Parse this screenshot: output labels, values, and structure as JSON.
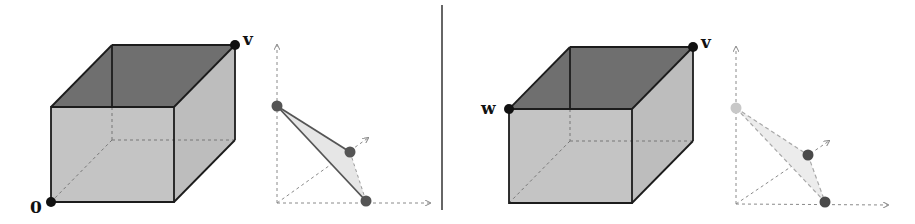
{
  "colors": {
    "top_face": "#6f6f6f",
    "front_face": "#c4c4c4",
    "side_face": "#bdbdbd",
    "edge": "#1c1c1c",
    "hidden_edge": "#777777",
    "axis": "#8a8a8a",
    "vertex": "#111111",
    "point_dark": "#555555",
    "point_light": "#c8c8c8",
    "triangle_fill": "#e6e6e6",
    "divider": "#333333"
  },
  "left_panel": {
    "cube": {
      "labels": {
        "origin": "0",
        "corner": "v"
      }
    },
    "simplex": {
      "style": "solid",
      "points": [
        "top",
        "middle",
        "bottom"
      ]
    }
  },
  "right_panel": {
    "cube": {
      "labels": {
        "corner_w": "w",
        "corner_v": "v"
      }
    },
    "simplex": {
      "style": "dashed",
      "points": [
        "top-light",
        "middle",
        "bottom"
      ]
    }
  }
}
